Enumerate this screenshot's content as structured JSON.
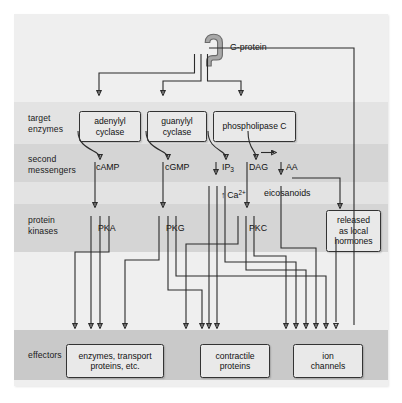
{
  "figure": {
    "background": "#efefef",
    "band_color_light": "#e3e3e3",
    "band_color_mid": "#d5d5d5",
    "box_fill": "#e9e9e9",
    "line_color": "#2b2b2b"
  },
  "receptor": {
    "icon": "g-protein-icon",
    "label": "G-protein"
  },
  "rows": [
    {
      "id": "target-enzymes",
      "label": "target\nenzymes"
    },
    {
      "id": "second-messengers",
      "label": "second\nmessengers"
    },
    {
      "id": "protein-kinases",
      "label": "protein\nkinases"
    },
    {
      "id": "effectors",
      "label": "effectors"
    }
  ],
  "target_enzymes": [
    {
      "id": "adenylyl-cyclase",
      "label": "adenylyl\ncyclase"
    },
    {
      "id": "guanylyl-cyclase",
      "label": "guanylyl\ncyclase"
    },
    {
      "id": "phospholipase-c",
      "label": "phospholipase C"
    }
  ],
  "second_messengers": [
    {
      "id": "camp",
      "label": "cAMP"
    },
    {
      "id": "cgmp",
      "label": "cGMP"
    },
    {
      "id": "ip3",
      "label": "IP3",
      "html": "IP<sub>3</sub>"
    },
    {
      "id": "dag",
      "label": "DAG"
    },
    {
      "id": "aa",
      "label": "AA"
    },
    {
      "id": "calcium",
      "label": "Ca2+",
      "html": "&#8593; Ca<sup>2+</sup>"
    },
    {
      "id": "eicosanoids",
      "label": "eicosanoids"
    }
  ],
  "protein_kinases": [
    {
      "id": "pka",
      "label": "PKA"
    },
    {
      "id": "pkg",
      "label": "PKG"
    },
    {
      "id": "pkc",
      "label": "PKC"
    }
  ],
  "outputs": [
    {
      "id": "released-hormones",
      "label": "released\nas local\nhormones"
    }
  ],
  "effectors": [
    {
      "id": "enzymes-transport-proteins",
      "label": "enzymes, transport\nproteins, etc."
    },
    {
      "id": "contractile-proteins",
      "label": "contractile\nproteins"
    },
    {
      "id": "ion-channels",
      "label": "ion\nchannels"
    }
  ]
}
